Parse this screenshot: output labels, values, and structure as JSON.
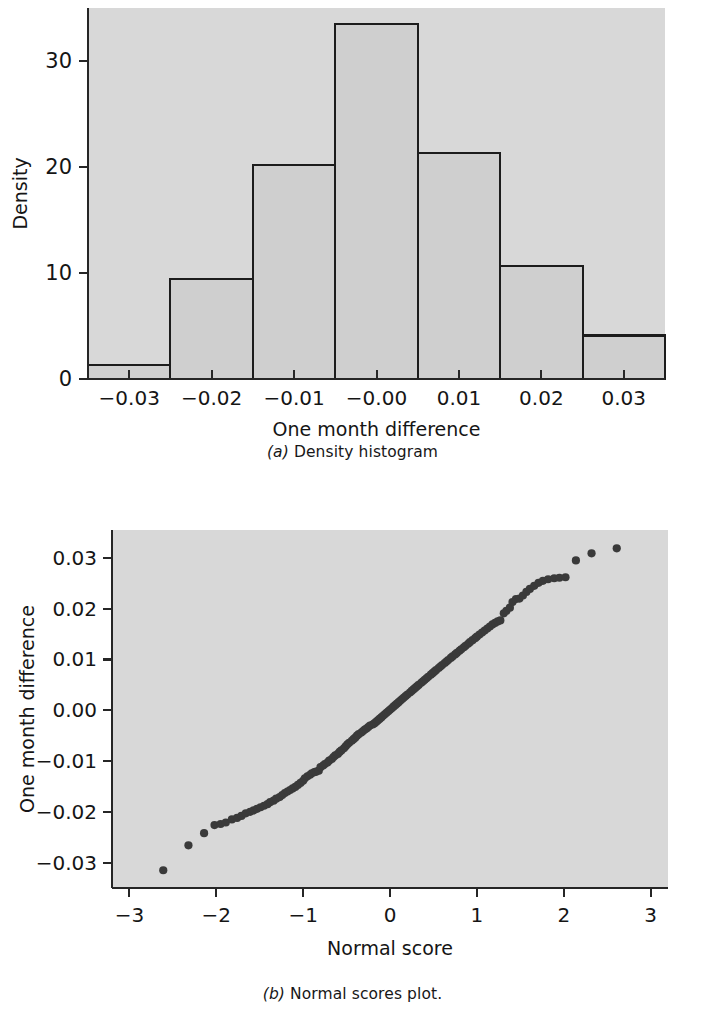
{
  "figure": {
    "background": "#ffffff",
    "panel_background": "#d8d8d8",
    "axis_color": "#262626",
    "bar_fill": "#cfcfcf",
    "bar_edge": "#1c1c1c",
    "point_color": "#3a3a3a"
  },
  "panel_a": {
    "caption_label": "(a)",
    "caption_text": " Density histogram"
  },
  "panel_b": {
    "caption_label": "(b)",
    "caption_text": " Normal scores plot."
  },
  "chart_data": [
    {
      "type": "bar",
      "id": "density-histogram",
      "title": "",
      "xlabel": "One month difference",
      "ylabel": "Density",
      "xlim": [
        -0.035,
        0.035
      ],
      "ylim": [
        0,
        35
      ],
      "xticks": [
        -0.03,
        -0.02,
        -0.01,
        -0.0,
        0.01,
        0.02,
        0.03
      ],
      "xticklabels": [
        "−0.03",
        "−0.02",
        "−0.01",
        "−0.00",
        "0.01",
        "0.02",
        "0.03"
      ],
      "yticks": [
        0,
        10,
        20,
        30
      ],
      "yticklabels": [
        "0",
        "10",
        "20",
        "30"
      ],
      "grid": false,
      "bin_edges": [
        -0.035,
        -0.025,
        -0.015,
        -0.005,
        0.005,
        0.015,
        0.025,
        0.035
      ],
      "categories": [
        "-0.035 to -0.025",
        "-0.025 to -0.015",
        "-0.015 to -0.005",
        "-0.005 to 0.005",
        "0.005 to 0.015",
        "0.015 to 0.025",
        "0.025 to 0.035"
      ],
      "values": [
        1.3,
        9.4,
        20.2,
        33.5,
        21.3,
        10.7,
        4.1
      ]
    },
    {
      "type": "scatter",
      "id": "normal-scores-plot",
      "title": "",
      "xlabel": "Normal score",
      "ylabel": "One month difference",
      "xlim": [
        -3.2,
        3.2
      ],
      "ylim": [
        -0.035,
        0.0355
      ],
      "xticks": [
        -3,
        -2,
        -1,
        0,
        1,
        2,
        3
      ],
      "xticklabels": [
        "−3",
        "−2",
        "−1",
        "0",
        "1",
        "2",
        "3"
      ],
      "yticks": [
        -0.03,
        -0.02,
        -0.01,
        0.0,
        0.01,
        0.02,
        0.03
      ],
      "yticklabels": [
        "−0.03",
        "−0.02",
        "−0.01",
        "0.00",
        "0.01",
        "0.02",
        "0.03"
      ],
      "grid": false,
      "x": [
        -2.61,
        -2.32,
        -2.14,
        -2.02,
        -1.95,
        -1.89,
        -1.82,
        -1.76,
        -1.71,
        -1.66,
        -1.61,
        -1.57,
        -1.53,
        -1.49,
        -1.45,
        -1.41,
        -1.38,
        -1.34,
        -1.31,
        -1.27,
        -1.24,
        -1.21,
        -1.18,
        -1.15,
        -1.12,
        -1.09,
        -1.06,
        -1.03,
        -1.0,
        -0.98,
        -0.95,
        -0.92,
        -0.9,
        -0.87,
        -0.85,
        -0.82,
        -0.8,
        -0.77,
        -0.75,
        -0.72,
        -0.7,
        -0.67,
        -0.65,
        -0.63,
        -0.6,
        -0.58,
        -0.56,
        -0.53,
        -0.51,
        -0.49,
        -0.47,
        -0.44,
        -0.42,
        -0.4,
        -0.38,
        -0.36,
        -0.33,
        -0.31,
        -0.29,
        -0.27,
        -0.25,
        -0.23,
        -0.2,
        -0.18,
        -0.16,
        -0.14,
        -0.12,
        -0.1,
        -0.08,
        -0.06,
        -0.04,
        -0.02,
        0.0,
        0.02,
        0.04,
        0.06,
        0.08,
        0.1,
        0.12,
        0.14,
        0.16,
        0.18,
        0.2,
        0.23,
        0.25,
        0.27,
        0.29,
        0.31,
        0.33,
        0.36,
        0.38,
        0.4,
        0.42,
        0.44,
        0.47,
        0.49,
        0.51,
        0.53,
        0.56,
        0.58,
        0.6,
        0.63,
        0.65,
        0.67,
        0.7,
        0.72,
        0.75,
        0.77,
        0.8,
        0.82,
        0.85,
        0.87,
        0.9,
        0.92,
        0.95,
        0.98,
        1.0,
        1.03,
        1.06,
        1.09,
        1.12,
        1.15,
        1.18,
        1.21,
        1.24,
        1.27,
        1.31,
        1.34,
        1.38,
        1.41,
        1.45,
        1.49,
        1.53,
        1.57,
        1.61,
        1.66,
        1.71,
        1.76,
        1.82,
        1.89,
        1.95,
        2.02,
        2.14,
        2.32,
        2.61
      ],
      "y": [
        -0.0315,
        -0.0266,
        -0.0242,
        -0.0226,
        -0.0224,
        -0.0221,
        -0.0215,
        -0.0212,
        -0.0208,
        -0.0203,
        -0.02,
        -0.0197,
        -0.0194,
        -0.0191,
        -0.0188,
        -0.0185,
        -0.0181,
        -0.0178,
        -0.0174,
        -0.0171,
        -0.0167,
        -0.0163,
        -0.016,
        -0.0157,
        -0.0154,
        -0.0151,
        -0.0147,
        -0.0143,
        -0.0139,
        -0.0134,
        -0.013,
        -0.0127,
        -0.0124,
        -0.0122,
        -0.0121,
        -0.0119,
        -0.0112,
        -0.0109,
        -0.0106,
        -0.0103,
        -0.0099,
        -0.0096,
        -0.0092,
        -0.0089,
        -0.0086,
        -0.0082,
        -0.0079,
        -0.0075,
        -0.0071,
        -0.0067,
        -0.0064,
        -0.006,
        -0.0057,
        -0.0054,
        -0.005,
        -0.0047,
        -0.0044,
        -0.0041,
        -0.0038,
        -0.0036,
        -0.0033,
        -0.003,
        -0.0028,
        -0.0026,
        -0.0023,
        -0.002,
        -0.0017,
        -0.0014,
        -0.0011,
        -0.0008,
        -0.0005,
        -0.0002,
        0.0001,
        0.0004,
        0.0007,
        0.001,
        0.0013,
        0.0016,
        0.0019,
        0.0022,
        0.0025,
        0.0028,
        0.0031,
        0.0035,
        0.0038,
        0.0041,
        0.0044,
        0.0047,
        0.005,
        0.0054,
        0.0057,
        0.006,
        0.0063,
        0.0066,
        0.007,
        0.0073,
        0.0076,
        0.0079,
        0.0083,
        0.0086,
        0.0089,
        0.0093,
        0.0096,
        0.0099,
        0.0103,
        0.0106,
        0.011,
        0.0113,
        0.0117,
        0.012,
        0.0124,
        0.0127,
        0.0131,
        0.0134,
        0.0138,
        0.0142,
        0.0145,
        0.0149,
        0.0153,
        0.0157,
        0.0161,
        0.0165,
        0.0169,
        0.0172,
        0.0175,
        0.0177,
        0.0191,
        0.0196,
        0.0202,
        0.0213,
        0.0219,
        0.022,
        0.0226,
        0.0233,
        0.0239,
        0.0245,
        0.0251,
        0.0255,
        0.0258,
        0.026,
        0.0261,
        0.0262,
        0.0295,
        0.0309,
        0.0319
      ]
    }
  ]
}
